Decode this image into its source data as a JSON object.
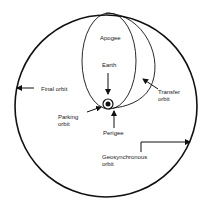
{
  "diagram": {
    "type": "orbital-transfer",
    "colors": {
      "line": "#111111",
      "text": "#1a1a1a",
      "background": "#ffffff"
    },
    "labels": {
      "apogee": "Apogee",
      "earth": "Earth",
      "final_orbit": "Final orbit",
      "transfer_orbit_1": "Transfer",
      "transfer_orbit_2": "orbit",
      "parking_orbit_1": "Parking",
      "parking_orbit_2": "orbit",
      "perigee": "Perigee",
      "geosync_1": "Geosynchronous",
      "geosync_2": "orbit"
    }
  }
}
